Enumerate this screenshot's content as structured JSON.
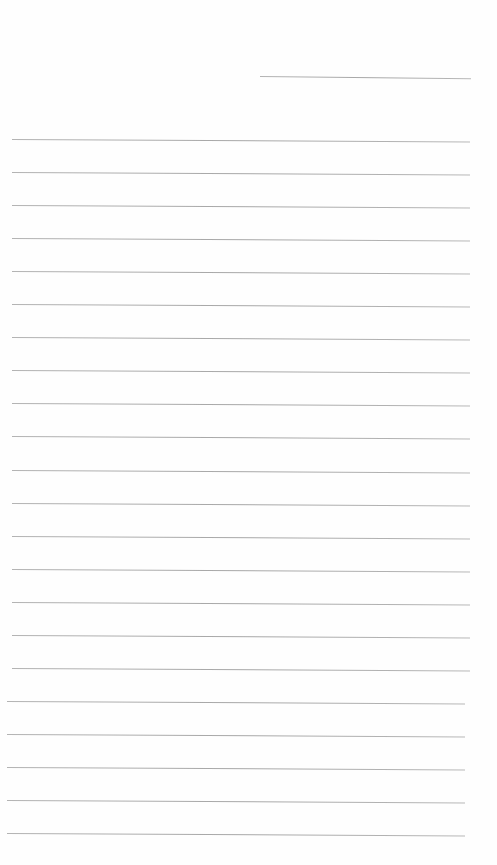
{
  "document": {
    "type": "lined-paper",
    "header_line": {
      "x": 260,
      "y": 76,
      "width": 211
    },
    "ruled_lines": {
      "count": 22,
      "start_y": 139,
      "spacing": 33.05,
      "x": 12,
      "width": 458
    },
    "line_color": "#8a8a8a",
    "background": "#fefefe",
    "text": []
  }
}
